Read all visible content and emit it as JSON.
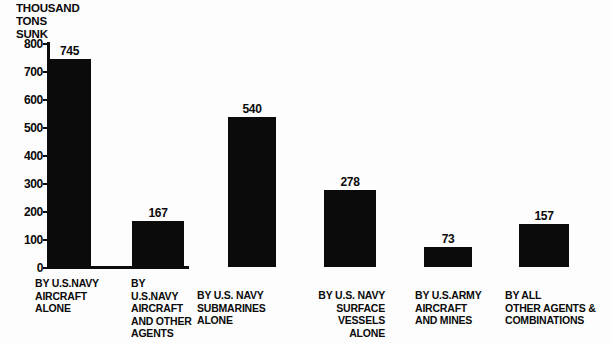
{
  "chart_data": {
    "type": "bar",
    "title": "THOUSAND TONS SUNK",
    "title_lines": [
      "THOUSAND",
      "TONS",
      "SUNK"
    ],
    "xlabel": "",
    "ylabel": "THOUSAND TONS SUNK",
    "ylim": [
      0,
      800
    ],
    "grid": false,
    "legend": "none",
    "yticks": [
      800,
      700,
      600,
      500,
      400,
      300,
      200,
      100,
      0
    ],
    "ytick_labels": [
      "800",
      "700",
      "600",
      "500",
      "400",
      "300",
      "200",
      "100",
      "0"
    ],
    "categories": [
      "BY U.S.NAVY AIRCRAFT ALONE",
      "BY U.S.NAVY AIRCRAFT AND OTHER AGENTS",
      "BY U.S. NAVY SUBMARINES ALONE",
      "BY U.S. NAVY SURFACE VESSELS ALONE",
      "BY U.S.ARMY AIRCRAFT AND MINES",
      "BY ALL OTHER AGENTS & COMBINATIONS"
    ],
    "values": [
      745,
      167,
      540,
      278,
      73,
      157
    ],
    "value_labels": [
      "745",
      "167",
      "540",
      "278",
      "73",
      "157"
    ],
    "bar_color": "#0b0b0b",
    "background_color": "#fdfdfd"
  },
  "bars": [
    {
      "value_label": "745",
      "label_lines": [
        "BY U.S.NAVY",
        "AIRCRAFT",
        "ALONE"
      ],
      "label_align": "left"
    },
    {
      "value_label": "167",
      "label_lines": [
        "BY",
        "U.S.NAVY",
        "AIRCRAFT",
        "AND OTHER",
        "AGENTS"
      ],
      "label_align": "left"
    },
    {
      "value_label": "540",
      "label_lines": [
        "BY U.S. NAVY",
        "SUBMARINES",
        "ALONE"
      ],
      "label_align": "left"
    },
    {
      "value_label": "278",
      "label_lines": [
        "BY U.S. NAVY",
        "SURFACE",
        "VESSELS",
        "ALONE"
      ],
      "label_align": "right"
    },
    {
      "value_label": "73",
      "label_lines": [
        "BY U.S.ARMY",
        "AIRCRAFT",
        "AND MINES"
      ],
      "label_align": "left"
    },
    {
      "value_label": "157",
      "label_lines": [
        "BY ALL",
        "OTHER AGENTS &",
        "COMBINATIONS"
      ],
      "label_align": "left"
    }
  ]
}
